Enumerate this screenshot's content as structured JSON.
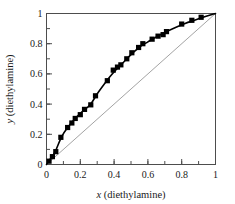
{
  "chart_data": {
    "type": "scatter",
    "title": "",
    "subtitle": "",
    "xlabel_var": "x",
    "xlabel_rest": " (diethylamine)",
    "ylabel_var": "y",
    "ylabel_rest": " (diethylamine)",
    "xlabel": "x (diethylamine)",
    "ylabel": "y (diethylamine)",
    "xlim": [
      0,
      1
    ],
    "ylim": [
      0,
      1
    ],
    "grid": false,
    "legend": null,
    "legend_position": "none",
    "xticks": [
      0,
      0.2,
      0.4,
      0.6,
      0.8,
      1
    ],
    "xticklabels": [
      "0",
      "0.2",
      "0.4",
      "0.6",
      "0.8",
      "1"
    ],
    "yticks": [
      0,
      0.2,
      0.4,
      0.6,
      0.8,
      1
    ],
    "yticklabels": [
      "0",
      "0.2",
      "0.4",
      "0.6",
      "0.8",
      "1"
    ],
    "minor_tick_step": 0.1,
    "marker_shape": "filled-square",
    "marker_color": "#000000",
    "curve_color": "#000000",
    "diagonal_color": "#8c8c8c",
    "frame_color": "#4d4d4d",
    "series": [
      {
        "name": "experimental",
        "x": [
          0.015,
          0.035,
          0.055,
          0.085,
          0.125,
          0.15,
          0.17,
          0.2,
          0.225,
          0.262,
          0.29,
          0.36,
          0.395,
          0.42,
          0.44,
          0.475,
          0.505,
          0.545,
          0.57,
          0.625,
          0.66,
          0.69,
          0.71,
          0.8,
          0.86,
          0.915
        ],
        "y": [
          0.022,
          0.052,
          0.085,
          0.18,
          0.245,
          0.275,
          0.305,
          0.33,
          0.365,
          0.395,
          0.455,
          0.555,
          0.625,
          0.645,
          0.66,
          0.7,
          0.74,
          0.775,
          0.8,
          0.83,
          0.85,
          0.86,
          0.88,
          0.93,
          0.955,
          0.975
        ]
      },
      {
        "name": "fitted-curve",
        "x": [
          0.0,
          0.02,
          0.05,
          0.09,
          0.13,
          0.17,
          0.21,
          0.26,
          0.3,
          0.34,
          0.38,
          0.42,
          0.46,
          0.5,
          0.55,
          0.6,
          0.65,
          0.7,
          0.76,
          0.82,
          0.88,
          0.94,
          1.0
        ],
        "y": [
          0.0,
          0.032,
          0.082,
          0.185,
          0.252,
          0.305,
          0.348,
          0.398,
          0.468,
          0.53,
          0.588,
          0.638,
          0.682,
          0.728,
          0.778,
          0.812,
          0.845,
          0.875,
          0.906,
          0.934,
          0.957,
          0.98,
          1.0
        ]
      },
      {
        "name": "y-equals-x-diagonal",
        "x": [
          0,
          1
        ],
        "y": [
          0,
          1
        ]
      }
    ]
  }
}
